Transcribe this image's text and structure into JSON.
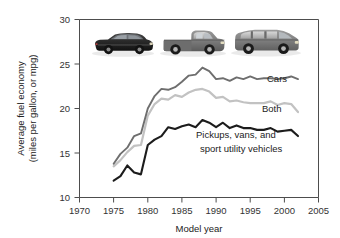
{
  "chart_data": {
    "type": "line",
    "title": "",
    "xlabel": "Model year",
    "ylabel": "Average fuel economy (miles per gallon, or mpg)",
    "ylabel_line1": "Average fuel economy",
    "ylabel_line2": "(miles per gallon, or mpg)",
    "xlim": [
      1970,
      2005
    ],
    "ylim": [
      10,
      30
    ],
    "xticks": [
      1970,
      1975,
      1980,
      1985,
      1990,
      1995,
      2000,
      2005
    ],
    "xtick_labels": [
      "1970",
      "1975",
      "1980",
      "1985",
      "1990",
      "1995",
      "2000",
      "2005"
    ],
    "yticks": [
      10,
      15,
      20,
      25,
      30
    ],
    "ytick_labels": [
      "10",
      "15",
      "20",
      "25",
      "30"
    ],
    "grid": false,
    "legend_position": "inline-annotations",
    "x": [
      1975,
      1976,
      1977,
      1978,
      1979,
      1980,
      1981,
      1982,
      1983,
      1984,
      1985,
      1986,
      1987,
      1988,
      1989,
      1990,
      1991,
      1992,
      1993,
      1994,
      1995,
      1996,
      1997,
      1998,
      1999,
      2000,
      2001,
      2002
    ],
    "series": [
      {
        "name": "Cars",
        "label": "Cars",
        "color": "#6e6e6e",
        "values": [
          13.8,
          14.9,
          15.6,
          16.9,
          17.2,
          20.0,
          21.4,
          22.2,
          22.1,
          22.4,
          23.0,
          23.7,
          23.8,
          24.6,
          24.2,
          23.3,
          23.4,
          23.1,
          23.5,
          23.3,
          23.6,
          23.3,
          23.4,
          23.4,
          23.3,
          23.4,
          23.6,
          23.3
        ]
      },
      {
        "name": "Both",
        "label": "Both",
        "color": "#c2c2c2",
        "values": [
          13.5,
          14.2,
          15.1,
          15.8,
          15.9,
          19.2,
          20.5,
          21.1,
          21.0,
          21.5,
          21.3,
          21.8,
          22.1,
          22.2,
          21.9,
          21.2,
          21.3,
          20.8,
          20.9,
          20.7,
          20.6,
          20.6,
          20.6,
          20.8,
          20.4,
          20.6,
          20.5,
          19.6
        ]
      },
      {
        "name": "Pickups, vans, and sport utility vehicles",
        "label_line1": "Pickups, vans, and",
        "label_line2": "sport utility vehicles",
        "color": "#1c1c1c",
        "values": [
          11.9,
          12.4,
          13.6,
          12.8,
          12.6,
          15.9,
          16.5,
          16.9,
          17.9,
          17.7,
          18.0,
          18.2,
          17.9,
          18.7,
          18.4,
          17.9,
          18.4,
          17.8,
          18.1,
          17.8,
          17.8,
          17.6,
          17.6,
          17.8,
          17.4,
          17.5,
          17.6,
          16.9
        ]
      }
    ],
    "annotations": [
      {
        "name": "cars-label",
        "text": "Cars"
      },
      {
        "name": "both-label",
        "text": "Both"
      },
      {
        "name": "trucks-label-line1",
        "text": "Pickups, vans, and"
      },
      {
        "name": "trucks-label-line2",
        "text": "sport utility vehicles"
      }
    ],
    "vehicle_icons": [
      {
        "name": "sedan-car-photo",
        "alt": "dark sedan car"
      },
      {
        "name": "pickup-truck-photo",
        "alt": "gray pickup truck"
      },
      {
        "name": "suv-wagon-photo",
        "alt": "gray sport utility vehicle"
      }
    ]
  }
}
